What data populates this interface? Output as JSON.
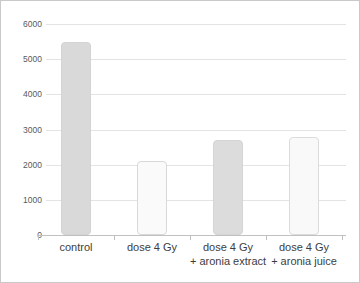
{
  "chart_data": {
    "type": "bar",
    "title": "",
    "xlabel": "",
    "ylabel": "",
    "categories": [
      [
        "control"
      ],
      [
        "dose 4 Gy"
      ],
      [
        "dose 4 Gy",
        "+ aronia extract"
      ],
      [
        "dose 4 Gy",
        "+ aronia juice"
      ]
    ],
    "values": [
      5500,
      2100,
      2700,
      2800
    ],
    "ylim": [
      0,
      6000
    ],
    "yticks": [
      0,
      1000,
      2000,
      3000,
      4000,
      5000,
      6000
    ],
    "grid": true,
    "legend": false,
    "bar_styles": [
      {
        "fill": "#d9d9d9",
        "border": "#d3d3d3"
      },
      {
        "fill": "#fafafa",
        "border": "#d9d9d9"
      },
      {
        "fill": "#dcdcdc",
        "border": "#d5d5d5"
      },
      {
        "fill": "#f9f9f9",
        "border": "#dcdcdc"
      }
    ],
    "colors": {
      "gridline": "#e3e3e3",
      "axis": "#c0c0c0",
      "ytick_text": "#595959",
      "category_text": "#3d3d3d",
      "background": "#ffffff",
      "frame_border": "#c9c9c9"
    }
  }
}
